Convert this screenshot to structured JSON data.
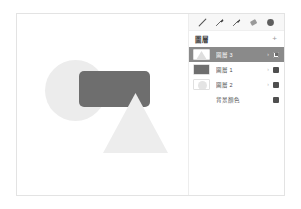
{
  "toolbar": {
    "tools": [
      {
        "name": "pen-tool-icon",
        "label": "鋼筆"
      },
      {
        "name": "brush-tool-icon",
        "label": "筆刷"
      },
      {
        "name": "marker-tool-icon",
        "label": "麥克筆"
      },
      {
        "name": "eraser-tool-icon",
        "label": "橡皮擦"
      },
      {
        "name": "color-swatch-icon",
        "label": "顏色"
      }
    ]
  },
  "layers_panel": {
    "title": "圖層",
    "add_label": "+",
    "chevron_glyph": "›",
    "rows": [
      {
        "name": "圖層 3",
        "thumb": "triangle",
        "selected": true,
        "visible": true
      },
      {
        "name": "圖層 1",
        "thumb": "rect",
        "selected": false,
        "visible": true
      },
      {
        "name": "圖層 2",
        "thumb": "circle",
        "selected": false,
        "visible": true
      },
      {
        "name": "背景顏色",
        "thumb": "none",
        "selected": false,
        "visible": true
      }
    ]
  },
  "canvas": {
    "shapes": [
      {
        "name": "circle-shape",
        "color": "#ececec"
      },
      {
        "name": "rectangle-shape",
        "color": "#6e6e6e"
      },
      {
        "name": "triangle-shape",
        "color": "#ededed"
      }
    ]
  },
  "colors": {
    "selected_row_bg": "#8a8a8a",
    "panel_border": "#ededed",
    "toolbar_bg": "#f7f7f7",
    "window_border": "#e3e3e3"
  }
}
